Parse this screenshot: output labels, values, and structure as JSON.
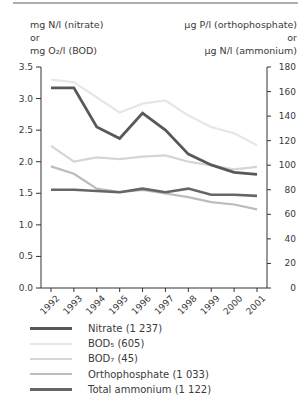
{
  "page": {
    "background": "#ffffff",
    "top_rule_color": "#aeaeae",
    "axis_line_color": "#333333",
    "text_color": "#3a3a3a"
  },
  "chart_data": {
    "type": "line",
    "grid": false,
    "legend_position": "bottom-left",
    "x": [
      "1992",
      "1993",
      "1994",
      "1995",
      "1996",
      "1997",
      "1998",
      "1999",
      "2000",
      "2001"
    ],
    "axes": {
      "left": {
        "title_lines": [
          "mg N/l (nitrate)",
          "or",
          "mg O₂/l (BOD)"
        ],
        "range": [
          0,
          3.5
        ],
        "tick_labels": [
          "0.0",
          "0.5",
          "1.0",
          "1.5",
          "2.0",
          "2.5",
          "3.0",
          "3.5"
        ]
      },
      "right": {
        "title_lines": [
          "µg P/l (orthophosphate)",
          "or",
          "µg N/l (ammonium)"
        ],
        "range": [
          0,
          180
        ],
        "tick_labels": [
          "0",
          "20",
          "40",
          "60",
          "80",
          "100",
          "120",
          "140",
          "160",
          "180"
        ]
      }
    },
    "series": [
      {
        "name": "Nitrate (1 237)",
        "axis": "left",
        "color": "#585858",
        "stroke_width": 2.8,
        "values": [
          3.17,
          3.17,
          2.55,
          2.37,
          2.77,
          2.5,
          2.12,
          1.95,
          1.83,
          1.8
        ]
      },
      {
        "name": "BOD₅ (605)",
        "axis": "left",
        "color": "#e6e6e6",
        "stroke_width": 2.2,
        "values": [
          3.3,
          3.26,
          3.02,
          2.78,
          2.92,
          2.97,
          2.73,
          2.55,
          2.45,
          2.26
        ]
      },
      {
        "name": "BOD₇ (45)",
        "axis": "left",
        "color": "#d5d5d5",
        "stroke_width": 2.2,
        "values": [
          2.25,
          2.0,
          2.07,
          2.04,
          2.08,
          2.1,
          2.0,
          1.94,
          1.88,
          1.92
        ]
      },
      {
        "name": "Orthophosphate (1 033)",
        "axis": "right",
        "color": "#bcbcbc",
        "stroke_width": 2.2,
        "values": [
          99,
          93,
          81,
          78,
          80,
          77,
          74,
          70,
          68,
          64
        ]
      },
      {
        "name": "Total ammonium (1 122)",
        "axis": "right",
        "color": "#666666",
        "stroke_width": 2.6,
        "values": [
          80,
          80,
          79,
          78,
          81,
          78,
          81,
          76,
          76,
          75
        ]
      }
    ]
  }
}
